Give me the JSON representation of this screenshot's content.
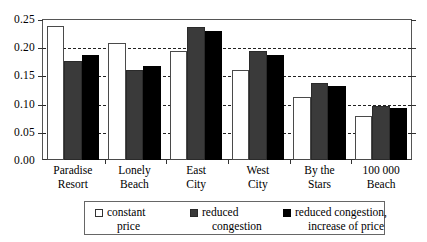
{
  "chart_data": {
    "type": "bar",
    "title": "",
    "xlabel": "",
    "ylabel": "",
    "ylim": [
      0.0,
      0.25
    ],
    "grid": true,
    "legend_position": "bottom",
    "categories": [
      "Paradise Resort",
      "Lonely Beach",
      "East City",
      "West City",
      "By the Stars",
      "100 000 Beach"
    ],
    "category_lines": [
      [
        "Paradise",
        "Resort"
      ],
      [
        "Lonely",
        "Beach"
      ],
      [
        "East",
        "City"
      ],
      [
        "West",
        "City"
      ],
      [
        "By the",
        "Stars"
      ],
      [
        "100 000",
        "Beach"
      ]
    ],
    "ytick_labels": [
      "0.00",
      "0.05",
      "0.10",
      "0.15",
      "0.20",
      "0.25"
    ],
    "ytick_values": [
      0.0,
      0.05,
      0.1,
      0.15,
      0.2,
      0.25
    ],
    "series": [
      {
        "name": "constant price",
        "name_lines": [
          "constant",
          "price"
        ],
        "color": "#ffffff",
        "values": [
          0.238,
          0.207,
          0.193,
          0.159,
          0.112,
          0.078
        ]
      },
      {
        "name": "reduced congestion",
        "name_lines": [
          "reduced",
          "congestion"
        ],
        "color": "#3a3a3a",
        "values": [
          0.175,
          0.16,
          0.235,
          0.193,
          0.137,
          0.095
        ]
      },
      {
        "name": "reduced congestion, increase of price",
        "name_lines": [
          "reduced congestion,",
          "increase of price"
        ],
        "color": "#000000",
        "values": [
          0.187,
          0.166,
          0.228,
          0.186,
          0.131,
          0.092
        ]
      }
    ]
  }
}
